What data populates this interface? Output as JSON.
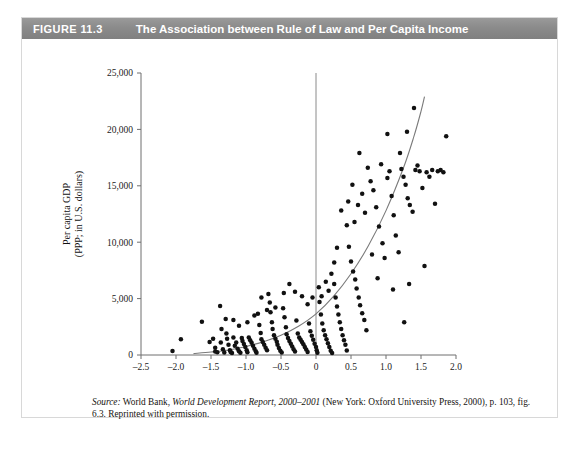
{
  "figure": {
    "number": "FIGURE 11.3",
    "title": "The Association between Rule of Law and Per Capita Income"
  },
  "source": {
    "label": "Source:",
    "text_1": " World Bank, ",
    "italic_1": "World Development Report, 2000–2001",
    "text_2": " (New York: Oxford University Press, 2000), p. 103, fig. 6.3. Reprinted with permission."
  },
  "colors": {
    "header_bar": "#8c8c8c",
    "header_text": "#ffffff",
    "point": "#111111",
    "curve": "#7a7a7a",
    "axis": "#6e6e6e",
    "card_border": "#d8d8d8",
    "background": "#ffffff"
  },
  "chart_data": {
    "type": "scatter",
    "title": "The Association between Rule of Law and Per Capita Income",
    "xlabel": "Rule of law index",
    "ylabel": "Per capita GDP (PPP; in U.S. dollars)",
    "ylabel_line1": "Per capita GDP",
    "ylabel_line2": "(PPP; in U.S. dollars)",
    "xlim": [
      -2.5,
      2.0
    ],
    "ylim": [
      0,
      25000
    ],
    "xticks": [
      -2.5,
      -2.0,
      -1.5,
      -1.0,
      -0.5,
      0,
      0.5,
      1.0,
      1.5,
      2.0
    ],
    "xticklabels": [
      "–2.5",
      "–2.0",
      "–1.5",
      "–1.0",
      "–0.5",
      "0",
      "0.5",
      "1.0",
      "1.5",
      "2.0"
    ],
    "yticks": [
      0,
      5000,
      10000,
      15000,
      20000,
      25000
    ],
    "yticklabels": [
      "0",
      "5,000",
      "10,000",
      "15,000",
      "20,000",
      "25,000"
    ],
    "grid": false,
    "legend": null,
    "reference_lines": [
      {
        "orientation": "vertical",
        "x": 0,
        "note": "vertical reference line at rule of law index = 0"
      }
    ],
    "fit_curve": {
      "kind": "exponential-trend",
      "note": "smooth rising curve through the cloud",
      "points": [
        [
          -1.75,
          120
        ],
        [
          -1.5,
          260
        ],
        [
          -1.25,
          450
        ],
        [
          -1.0,
          760
        ],
        [
          -0.75,
          1180
        ],
        [
          -0.5,
          1750
        ],
        [
          -0.25,
          2550
        ],
        [
          0.0,
          3650
        ],
        [
          0.25,
          5200
        ],
        [
          0.5,
          7200
        ],
        [
          0.75,
          9700
        ],
        [
          1.0,
          12800
        ],
        [
          1.25,
          16600
        ],
        [
          1.4,
          19400
        ],
        [
          1.5,
          21600
        ],
        [
          1.55,
          22900
        ]
      ]
    },
    "points": [
      [
        -2.05,
        350
      ],
      [
        -1.93,
        1400
      ],
      [
        -1.63,
        2950
      ],
      [
        -1.52,
        1150
      ],
      [
        -1.47,
        1450
      ],
      [
        -1.44,
        300
      ],
      [
        -1.41,
        250
      ],
      [
        -1.37,
        4350
      ],
      [
        -1.35,
        2300
      ],
      [
        -1.33,
        500
      ],
      [
        -1.31,
        230
      ],
      [
        -1.29,
        3200
      ],
      [
        -1.27,
        1450
      ],
      [
        -1.25,
        900
      ],
      [
        -1.23,
        420
      ],
      [
        -1.22,
        260
      ],
      [
        -1.2,
        180
      ],
      [
        -1.18,
        1550
      ],
      [
        -1.16,
        820
      ],
      [
        -1.14,
        1100
      ],
      [
        -1.12,
        560
      ],
      [
        -1.1,
        330
      ],
      [
        -1.08,
        210
      ],
      [
        -1.06,
        1500
      ],
      [
        -1.05,
        1250
      ],
      [
        -1.03,
        980
      ],
      [
        -1.01,
        700
      ],
      [
        -0.99,
        430
      ],
      [
        -0.98,
        250
      ],
      [
        -0.96,
        1550
      ],
      [
        -0.94,
        1300
      ],
      [
        -0.92,
        1080
      ],
      [
        -0.9,
        820
      ],
      [
        -0.88,
        560
      ],
      [
        -0.86,
        340
      ],
      [
        -0.85,
        200
      ],
      [
        -0.83,
        3650
      ],
      [
        -0.81,
        2650
      ],
      [
        -0.79,
        1950
      ],
      [
        -0.78,
        1400
      ],
      [
        -0.76,
        1150
      ],
      [
        -0.74,
        900
      ],
      [
        -0.72,
        640
      ],
      [
        -0.7,
        420
      ],
      [
        -0.68,
        5400
      ],
      [
        -0.66,
        4650
      ],
      [
        -0.65,
        3800
      ],
      [
        -0.63,
        2900
      ],
      [
        -0.62,
        2300
      ],
      [
        -0.6,
        1750
      ],
      [
        -0.58,
        1450
      ],
      [
        -0.56,
        1180
      ],
      [
        -0.55,
        900
      ],
      [
        -0.53,
        620
      ],
      [
        -0.51,
        380
      ],
      [
        -0.49,
        230
      ],
      [
        -0.47,
        4150
      ],
      [
        -0.45,
        3350
      ],
      [
        -0.43,
        2450
      ],
      [
        -0.42,
        1850
      ],
      [
        -0.4,
        1500
      ],
      [
        -0.38,
        1250
      ],
      [
        -0.36,
        1000
      ],
      [
        -0.34,
        760
      ],
      [
        -0.32,
        500
      ],
      [
        -0.3,
        300
      ],
      [
        -0.28,
        3050
      ],
      [
        -0.26,
        1900
      ],
      [
        -0.24,
        1550
      ],
      [
        -0.22,
        1350
      ],
      [
        -0.2,
        1150
      ],
      [
        -0.18,
        950
      ],
      [
        -0.16,
        720
      ],
      [
        -0.14,
        480
      ],
      [
        -0.12,
        260
      ],
      [
        -0.1,
        2800
      ],
      [
        -0.08,
        2100
      ],
      [
        -0.06,
        1700
      ],
      [
        -0.04,
        1350
      ],
      [
        -0.02,
        1000
      ],
      [
        0.0,
        700
      ],
      [
        0.01,
        420
      ],
      [
        0.02,
        200
      ],
      [
        0.05,
        4700
      ],
      [
        0.07,
        3600
      ],
      [
        0.09,
        2800
      ],
      [
        0.11,
        2200
      ],
      [
        0.13,
        1750
      ],
      [
        0.15,
        1400
      ],
      [
        0.17,
        1050
      ],
      [
        0.19,
        700
      ],
      [
        0.21,
        380
      ],
      [
        0.23,
        180
      ],
      [
        0.26,
        6300
      ],
      [
        0.28,
        5100
      ],
      [
        0.3,
        4300
      ],
      [
        0.32,
        3600
      ],
      [
        0.34,
        2900
      ],
      [
        0.36,
        2300
      ],
      [
        0.38,
        1750
      ],
      [
        0.4,
        1300
      ],
      [
        0.42,
        900
      ],
      [
        0.44,
        400
      ],
      [
        0.47,
        9600
      ],
      [
        0.5,
        8300
      ],
      [
        0.53,
        7400
      ],
      [
        0.56,
        6700
      ],
      [
        0.58,
        5900
      ],
      [
        0.61,
        5100
      ],
      [
        0.63,
        4400
      ],
      [
        0.66,
        3700
      ],
      [
        0.69,
        3100
      ],
      [
        0.72,
        2200
      ],
      [
        0.55,
        11800
      ],
      [
        0.6,
        13300
      ],
      [
        0.66,
        14300
      ],
      [
        0.7,
        12600
      ],
      [
        0.74,
        16600
      ],
      [
        0.78,
        15400
      ],
      [
        0.82,
        14600
      ],
      [
        0.86,
        13100
      ],
      [
        0.9,
        11400
      ],
      [
        0.95,
        9900
      ],
      [
        0.98,
        8600
      ],
      [
        1.02,
        15700
      ],
      [
        1.05,
        16300
      ],
      [
        1.08,
        14100
      ],
      [
        1.11,
        12400
      ],
      [
        1.14,
        10600
      ],
      [
        1.18,
        9100
      ],
      [
        1.22,
        16500
      ],
      [
        1.25,
        15800
      ],
      [
        1.28,
        15100
      ],
      [
        1.31,
        13900
      ],
      [
        1.34,
        13300
      ],
      [
        1.38,
        12700
      ],
      [
        1.42,
        16400
      ],
      [
        1.45,
        16800
      ],
      [
        1.48,
        16300
      ],
      [
        1.4,
        21900
      ],
      [
        1.3,
        19800
      ],
      [
        1.2,
        17900
      ],
      [
        1.52,
        14800
      ],
      [
        1.55,
        7900
      ],
      [
        1.58,
        16200
      ],
      [
        1.62,
        15800
      ],
      [
        1.66,
        16400
      ],
      [
        1.7,
        13400
      ],
      [
        1.74,
        16300
      ],
      [
        1.78,
        16400
      ],
      [
        1.82,
        16200
      ],
      [
        1.86,
        19400
      ],
      [
        1.26,
        2900
      ],
      [
        1.33,
        6300
      ],
      [
        1.1,
        5800
      ],
      [
        0.88,
        6800
      ],
      [
        0.8,
        8900
      ],
      [
        0.93,
        16900
      ],
      [
        1.02,
        19600
      ],
      [
        0.62,
        17900
      ],
      [
        0.52,
        15100
      ],
      [
        0.46,
        13600
      ],
      [
        0.44,
        11500
      ],
      [
        0.36,
        12800
      ],
      [
        0.3,
        9500
      ],
      [
        0.26,
        8200
      ],
      [
        0.22,
        7200
      ],
      [
        0.18,
        5700
      ],
      [
        0.14,
        6500
      ],
      [
        0.08,
        5200
      ],
      [
        0.04,
        6000
      ],
      [
        -0.05,
        5100
      ],
      [
        -0.12,
        4500
      ],
      [
        -0.2,
        5200
      ],
      [
        -0.3,
        5600
      ],
      [
        -0.38,
        6300
      ],
      [
        -0.46,
        5500
      ],
      [
        -0.58,
        4200
      ],
      [
        -0.7,
        4000
      ],
      [
        -0.78,
        5100
      ],
      [
        -0.88,
        3500
      ],
      [
        -0.98,
        2900
      ],
      [
        -1.1,
        2600
      ],
      [
        -1.18,
        3100
      ],
      [
        -1.28,
        1900
      ],
      [
        -1.36,
        1100
      ],
      [
        -1.44,
        650
      ]
    ]
  }
}
